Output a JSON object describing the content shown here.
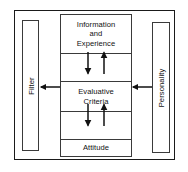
{
  "diagram": {
    "frame": {
      "name": "outer-boundary"
    },
    "center_boxes": [
      {
        "id": "information-experience",
        "label": "Information\nand\nExperience",
        "lines": [
          "Information",
          "and",
          "Experience"
        ]
      },
      {
        "id": "evaluative-criteria",
        "label": "Evaluative\nCriteria",
        "lines": [
          "Evaluative",
          "Criteria"
        ]
      },
      {
        "id": "attitude",
        "label": "Attitude",
        "lines": [
          "Attitude"
        ]
      }
    ],
    "side_boxes": [
      {
        "id": "filter",
        "label": "Filter",
        "position": "left",
        "orientation": "vertical"
      },
      {
        "id": "personality",
        "label": "Personality",
        "position": "right",
        "orientation": "vertical"
      }
    ],
    "arrows": [
      {
        "id": "info-to-eval",
        "from": "information-experience",
        "to": "evaluative-criteria",
        "direction": "down",
        "style": "solid"
      },
      {
        "id": "eval-to-info",
        "from": "evaluative-criteria",
        "to": "information-experience",
        "direction": "up",
        "style": "solid"
      },
      {
        "id": "eval-to-attitude",
        "from": "evaluative-criteria",
        "to": "attitude",
        "direction": "down",
        "style": "solid"
      },
      {
        "id": "attitude-to-eval",
        "from": "attitude",
        "to": "evaluative-criteria",
        "direction": "up",
        "style": "solid"
      },
      {
        "id": "eval-to-filter",
        "from": "evaluative-criteria",
        "to": "filter",
        "direction": "left",
        "style": "solid"
      },
      {
        "id": "personality-to-eval",
        "from": "personality",
        "to": "evaluative-criteria",
        "direction": "left",
        "style": "solid"
      }
    ],
    "colors": {
      "frame_stroke": "#1a1a1a",
      "box_stroke": "#3a3a3a",
      "arrow_stroke": "#111111",
      "text": "#111111",
      "background": "#ffffff"
    }
  }
}
